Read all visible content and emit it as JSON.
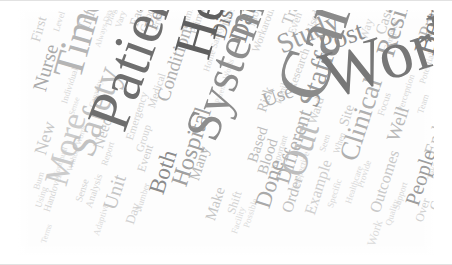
{
  "figure": {
    "type": "word-cloud",
    "width": 452,
    "height": 265,
    "background_color": "#ffffff",
    "canvas_color": "#fdfdfd",
    "palette": [
      "#5e5e5e",
      "#7a7a7a",
      "#8f8f8f",
      "#a6a6a6",
      "#bcbcbc",
      "#cfcfcf",
      "#dcdcdc",
      "#6b6b6b",
      "#999999"
    ],
    "font_style": "serif"
  },
  "chart_data": {
    "type": "word-cloud",
    "title": "",
    "words": [
      {
        "text": "Work",
        "weight": 100,
        "x": 295,
        "y": 38,
        "size": 68,
        "rot": -18,
        "color": "#777777"
      },
      {
        "text": "Care",
        "weight": 98,
        "x": 248,
        "y": 78,
        "size": 72,
        "rot": -72,
        "color": "#8a8a8a"
      },
      {
        "text": "Patient",
        "weight": 95,
        "x": 62,
        "y": 108,
        "size": 60,
        "rot": -70,
        "color": "#6e6e6e"
      },
      {
        "text": "Health",
        "weight": 88,
        "x": 150,
        "y": 40,
        "size": 54,
        "rot": -74,
        "color": "#5f5f5f"
      },
      {
        "text": "System",
        "weight": 85,
        "x": 160,
        "y": 120,
        "size": 50,
        "rot": -70,
        "color": "#8d8d8d"
      },
      {
        "text": "Time",
        "weight": 70,
        "x": 30,
        "y": 62,
        "size": 42,
        "rot": -74,
        "color": "#b5b5b5"
      },
      {
        "text": "Safety",
        "weight": 62,
        "x": 48,
        "y": 140,
        "size": 36,
        "rot": -72,
        "color": "#c2c2c2"
      },
      {
        "text": "More",
        "weight": 58,
        "x": 22,
        "y": 170,
        "size": 34,
        "rot": -74,
        "color": "#cccccc"
      },
      {
        "text": "Out",
        "weight": 56,
        "x": 258,
        "y": 160,
        "size": 36,
        "rot": -72,
        "color": "#bdbdbd"
      },
      {
        "text": "Between",
        "weight": 55,
        "x": 392,
        "y": 40,
        "size": 30,
        "rot": -74,
        "color": "#7d7d7d"
      },
      {
        "text": "Resilience",
        "weight": 54,
        "x": 355,
        "y": 42,
        "size": 27,
        "rot": -73,
        "color": "#a4a4a4"
      },
      {
        "text": "Staff",
        "weight": 50,
        "x": 277,
        "y": 92,
        "size": 29,
        "rot": -72,
        "color": "#9a9a9a"
      },
      {
        "text": "Study",
        "weight": 49,
        "x": 255,
        "y": 24,
        "size": 28,
        "rot": -24,
        "color": "#9f9f9f"
      },
      {
        "text": "Clinical",
        "weight": 48,
        "x": 318,
        "y": 146,
        "size": 27,
        "rot": -72,
        "color": "#b0b0b0"
      },
      {
        "text": "Post",
        "weight": 46,
        "x": 297,
        "y": 24,
        "size": 27,
        "rot": -20,
        "color": "#8f8f8f"
      },
      {
        "text": "Data",
        "weight": 45,
        "x": 208,
        "y": 28,
        "size": 26,
        "rot": -73,
        "color": "#8b8b8b"
      },
      {
        "text": "Hospital",
        "weight": 44,
        "x": 150,
        "y": 172,
        "size": 24,
        "rot": -72,
        "color": "#a0a0a0"
      },
      {
        "text": "Discharge",
        "weight": 43,
        "x": 190,
        "y": 26,
        "size": 22,
        "rot": -73,
        "color": "#7f7f7f"
      },
      {
        "text": "Both",
        "weight": 42,
        "x": 128,
        "y": 180,
        "size": 23,
        "rot": -72,
        "color": "#8c8c8c"
      },
      {
        "text": "Done",
        "weight": 40,
        "x": 234,
        "y": 194,
        "size": 23,
        "rot": -72,
        "color": "#a9a9a9"
      },
      {
        "text": "Different",
        "weight": 39,
        "x": 255,
        "y": 170,
        "size": 21,
        "rot": -72,
        "color": "#b2b2b2"
      },
      {
        "text": "People",
        "weight": 38,
        "x": 385,
        "y": 192,
        "size": 21,
        "rot": -72,
        "color": "#9d9d9d"
      },
      {
        "text": "Unit",
        "weight": 36,
        "x": 82,
        "y": 196,
        "size": 20,
        "rot": -72,
        "color": "#c5c5c5"
      },
      {
        "text": "Nurse",
        "weight": 35,
        "x": 12,
        "y": 78,
        "size": 20,
        "rot": -74,
        "color": "#aaaaaa"
      },
      {
        "text": "Performance",
        "weight": 34,
        "x": 124,
        "y": 16,
        "size": 19,
        "rot": -70,
        "color": "#a3a3a3"
      },
      {
        "text": "Conditions",
        "weight": 33,
        "x": 136,
        "y": 88,
        "size": 19,
        "rot": -72,
        "color": "#b1b1b1"
      },
      {
        "text": "Practice",
        "weight": 32,
        "x": 398,
        "y": 24,
        "size": 19,
        "rot": -72,
        "color": "#b6b6b6"
      },
      {
        "text": "Well",
        "weight": 31,
        "x": 366,
        "y": 128,
        "size": 19,
        "rot": -72,
        "color": "#b8b8b8"
      },
      {
        "text": "Use",
        "weight": 31,
        "x": 242,
        "y": 82,
        "size": 20,
        "rot": -20,
        "color": "#adadad"
      },
      {
        "text": "Information",
        "weight": 30,
        "x": 58,
        "y": 16,
        "size": 17,
        "rot": -68,
        "color": "#c0c0c0"
      },
      {
        "text": "New",
        "weight": 29,
        "x": 14,
        "y": 142,
        "size": 18,
        "rot": -73,
        "color": "#c8c8c8"
      },
      {
        "text": "End",
        "weight": 28,
        "x": 404,
        "y": 142,
        "size": 18,
        "rot": -72,
        "color": "#c4c4c4"
      },
      {
        "text": "Outcomes",
        "weight": 27,
        "x": 350,
        "y": 200,
        "size": 16,
        "rot": -72,
        "color": "#c9c9c9"
      },
      {
        "text": "Example",
        "weight": 26,
        "x": 285,
        "y": 202,
        "size": 16,
        "rot": -72,
        "color": "#cfcfcf"
      },
      {
        "text": "Order",
        "weight": 25,
        "x": 262,
        "y": 200,
        "size": 16,
        "rot": -72,
        "color": "#c1c1c1"
      },
      {
        "text": "Many",
        "weight": 25,
        "x": 170,
        "y": 168,
        "size": 15,
        "rot": -72,
        "color": "#b9b9b9"
      },
      {
        "text": "Make",
        "weight": 24,
        "x": 186,
        "y": 208,
        "size": 15,
        "rot": -72,
        "color": "#c6c6c6"
      },
      {
        "text": "Blood",
        "weight": 24,
        "x": 238,
        "y": 162,
        "size": 15,
        "rot": -72,
        "color": "#bcbcbc"
      },
      {
        "text": "Based",
        "weight": 23,
        "x": 228,
        "y": 150,
        "size": 15,
        "rot": -72,
        "color": "#bebebe"
      },
      {
        "text": "Trade",
        "weight": 23,
        "x": 262,
        "y": 12,
        "size": 16,
        "rot": -70,
        "color": "#c3c3c3"
      },
      {
        "text": "Cases",
        "weight": 22,
        "x": 356,
        "y": 22,
        "size": 15,
        "rot": -72,
        "color": "#cacaca"
      },
      {
        "text": "Need",
        "weight": 22,
        "x": 74,
        "y": 136,
        "size": 15,
        "rot": -72,
        "color": "#c7c7c7"
      },
      {
        "text": "First",
        "weight": 21,
        "x": 12,
        "y": 30,
        "size": 14,
        "rot": -74,
        "color": "#cdcdcd"
      },
      {
        "text": "Risk",
        "weight": 21,
        "x": 238,
        "y": 100,
        "size": 14,
        "rot": -72,
        "color": "#c2c2c2"
      },
      {
        "text": "Site",
        "weight": 20,
        "x": 320,
        "y": 114,
        "size": 14,
        "rot": -72,
        "color": "#cbcbcb"
      },
      {
        "text": "Ward",
        "weight": 20,
        "x": 288,
        "y": 112,
        "size": 13,
        "rot": -72,
        "color": "#d0d0d0"
      },
      {
        "text": "Research",
        "weight": 20,
        "x": 268,
        "y": 78,
        "size": 12,
        "rot": -70,
        "color": "#cfcfcf"
      },
      {
        "text": "Workarounds",
        "weight": 19,
        "x": 232,
        "y": 40,
        "size": 11,
        "rot": -70,
        "color": "#d2d2d2"
      },
      {
        "text": "Case",
        "weight": 19,
        "x": 410,
        "y": 198,
        "size": 13,
        "rot": -72,
        "color": "#cccccc"
      },
      {
        "text": "Over",
        "weight": 18,
        "x": 396,
        "y": 210,
        "size": 12,
        "rot": -72,
        "color": "#d0d0d0"
      },
      {
        "text": "Within",
        "weight": 18,
        "x": 412,
        "y": 16,
        "size": 12,
        "rot": -72,
        "color": "#cacaca"
      },
      {
        "text": "Each",
        "weight": 18,
        "x": 110,
        "y": 14,
        "size": 13,
        "rot": -72,
        "color": "#cbcbcb"
      },
      {
        "text": "Good",
        "weight": 17,
        "x": 120,
        "y": 20,
        "size": 11,
        "rot": -72,
        "color": "#d4d4d4"
      },
      {
        "text": "Day",
        "weight": 17,
        "x": 106,
        "y": 212,
        "size": 13,
        "rot": -72,
        "color": "#d1d1d1"
      },
      {
        "text": "Event",
        "weight": 17,
        "x": 118,
        "y": 160,
        "size": 12,
        "rot": -72,
        "color": "#cecece"
      },
      {
        "text": "Shift",
        "weight": 16,
        "x": 208,
        "y": 202,
        "size": 12,
        "rot": -72,
        "color": "#d3d3d3"
      },
      {
        "text": "Medical",
        "weight": 16,
        "x": 128,
        "y": 96,
        "size": 11,
        "rot": -72,
        "color": "#d2d2d2"
      },
      {
        "text": "Emergency",
        "weight": 16,
        "x": 106,
        "y": 128,
        "size": 11,
        "rot": -72,
        "color": "#d5d5d5"
      },
      {
        "text": "Group",
        "weight": 16,
        "x": 116,
        "y": 140,
        "size": 11,
        "rot": -72,
        "color": "#d3d3d3"
      },
      {
        "text": "Process",
        "weight": 15,
        "x": 132,
        "y": 18,
        "size": 10,
        "rot": -72,
        "color": "#d6d6d6"
      },
      {
        "text": "Primary",
        "weight": 15,
        "x": 170,
        "y": 22,
        "size": 11,
        "rot": -72,
        "color": "#cdcdcd"
      },
      {
        "text": "Seamless",
        "weight": 15,
        "x": 160,
        "y": 20,
        "size": 10,
        "rot": -72,
        "color": "#d8d8d8"
      },
      {
        "text": "Home Safety",
        "weight": 14,
        "x": 184,
        "y": 60,
        "size": 9,
        "rot": -72,
        "color": "#d7d7d7"
      },
      {
        "text": "Those",
        "weight": 14,
        "x": 202,
        "y": 16,
        "size": 11,
        "rot": -72,
        "color": "#d4d4d4"
      },
      {
        "text": "Mode",
        "weight": 14,
        "x": 228,
        "y": 14,
        "size": 11,
        "rot": -72,
        "color": "#d5d5d5"
      },
      {
        "text": "Even",
        "weight": 14,
        "x": 268,
        "y": 22,
        "size": 11,
        "rot": -70,
        "color": "#d3d3d3"
      },
      {
        "text": "Used",
        "weight": 14,
        "x": 286,
        "y": 20,
        "size": 11,
        "rot": -70,
        "color": "#d1d1d1"
      },
      {
        "text": "Way",
        "weight": 14,
        "x": 340,
        "y": 28,
        "size": 12,
        "rot": -72,
        "color": "#d6d6d6"
      },
      {
        "text": "Complex",
        "weight": 13,
        "x": 364,
        "y": 40,
        "size": 9,
        "rot": -72,
        "color": "#d7d7d7"
      },
      {
        "text": "Focus",
        "weight": 13,
        "x": 358,
        "y": 104,
        "size": 10,
        "rot": -72,
        "color": "#d5d5d5"
      },
      {
        "text": "Potential",
        "weight": 13,
        "x": 400,
        "y": 72,
        "size": 9,
        "rot": -72,
        "color": "#d8d8d8"
      },
      {
        "text": "Implementation",
        "weight": 13,
        "x": 424,
        "y": 48,
        "size": 9,
        "rot": -72,
        "color": "#d9d9d9"
      },
      {
        "text": "Team",
        "weight": 13,
        "x": 398,
        "y": 102,
        "size": 9,
        "rot": -72,
        "color": "#d6d6d6"
      },
      {
        "text": "Perception",
        "weight": 12,
        "x": 378,
        "y": 100,
        "size": 9,
        "rot": -72,
        "color": "#d8d8d8"
      },
      {
        "text": "Human",
        "weight": 12,
        "x": 418,
        "y": 138,
        "size": 10,
        "rot": -72,
        "color": "#d4d4d4"
      },
      {
        "text": "Medication",
        "weight": 12,
        "x": 428,
        "y": 178,
        "size": 10,
        "rot": -72,
        "color": "#d5d5d5"
      },
      {
        "text": "Support",
        "weight": 12,
        "x": 374,
        "y": 198,
        "size": 9,
        "rot": -72,
        "color": "#d9d9d9"
      },
      {
        "text": "Quality",
        "weight": 12,
        "x": 366,
        "y": 214,
        "size": 9,
        "rot": -72,
        "color": "#dadada"
      },
      {
        "text": "Provide",
        "weight": 12,
        "x": 338,
        "y": 176,
        "size": 9,
        "rot": -72,
        "color": "#d7d7d7"
      },
      {
        "text": "Seen",
        "weight": 12,
        "x": 300,
        "y": 140,
        "size": 9,
        "rot": -72,
        "color": "#d6d6d6"
      },
      {
        "text": "When",
        "weight": 12,
        "x": 314,
        "y": 142,
        "size": 9,
        "rot": -72,
        "color": "#d4d4d4"
      },
      {
        "text": "Healthcare",
        "weight": 11,
        "x": 326,
        "y": 192,
        "size": 9,
        "rot": -72,
        "color": "#dadada"
      },
      {
        "text": "Specific",
        "weight": 11,
        "x": 308,
        "y": 196,
        "size": 9,
        "rot": -72,
        "color": "#d8d8d8"
      },
      {
        "text": "Perspective",
        "weight": 11,
        "x": 272,
        "y": 180,
        "size": 9,
        "rot": -72,
        "color": "#d9d9d9"
      },
      {
        "text": "Important",
        "weight": 11,
        "x": 252,
        "y": 158,
        "size": 9,
        "rot": -72,
        "color": "#d7d7d7"
      },
      {
        "text": "Possible",
        "weight": 11,
        "x": 224,
        "y": 216,
        "size": 9,
        "rot": -72,
        "color": "#dbdbdb"
      },
      {
        "text": "Facility",
        "weight": 11,
        "x": 212,
        "y": 222,
        "size": 9,
        "rot": -72,
        "color": "#dadada"
      },
      {
        "text": "Number",
        "weight": 11,
        "x": 116,
        "y": 200,
        "size": 9,
        "rot": -72,
        "color": "#d8d8d8"
      },
      {
        "text": "Analysis",
        "weight": 11,
        "x": 66,
        "y": 196,
        "size": 10,
        "rot": -72,
        "color": "#d6d6d6"
      },
      {
        "text": "Sense",
        "weight": 11,
        "x": 56,
        "y": 190,
        "size": 10,
        "rot": -72,
        "color": "#d5d5d5"
      },
      {
        "text": "Handover",
        "weight": 11,
        "x": 24,
        "y": 200,
        "size": 10,
        "rot": -72,
        "color": "#d7d7d7"
      },
      {
        "text": "Using",
        "weight": 10,
        "x": 16,
        "y": 196,
        "size": 9,
        "rot": -72,
        "color": "#d9d9d9"
      },
      {
        "text": "Adaptive",
        "weight": 10,
        "x": 74,
        "y": 224,
        "size": 9,
        "rot": -72,
        "color": "#dbdbdb"
      },
      {
        "text": "Report",
        "weight": 10,
        "x": 82,
        "y": 154,
        "size": 9,
        "rot": -72,
        "color": "#d8d8d8"
      },
      {
        "text": "Without Words",
        "weight": 10,
        "x": 48,
        "y": 160,
        "size": 8,
        "rot": -72,
        "color": "#dcdcdc"
      },
      {
        "text": "Individual",
        "weight": 10,
        "x": 42,
        "y": 92,
        "size": 9,
        "rot": -72,
        "color": "#d7d7d7"
      },
      {
        "text": "Sense",
        "weight": 10,
        "x": 50,
        "y": 104,
        "size": 8,
        "rot": -72,
        "color": "#dcdcdc"
      },
      {
        "text": "Continual",
        "weight": 10,
        "x": 34,
        "y": 166,
        "size": 8,
        "rot": -72,
        "color": "#dbdbdb"
      },
      {
        "text": "Capacity",
        "weight": 10,
        "x": 70,
        "y": 96,
        "size": 8,
        "rot": -72,
        "color": "#dcdcdc"
      },
      {
        "text": "Level",
        "weight": 10,
        "x": 34,
        "y": 20,
        "size": 9,
        "rot": -72,
        "color": "#d8d8d8"
      },
      {
        "text": "Diagram",
        "weight": 10,
        "x": 86,
        "y": 14,
        "size": 9,
        "rot": -72,
        "color": "#d9d9d9"
      },
      {
        "text": "Vary",
        "weight": 10,
        "x": 96,
        "y": 16,
        "size": 9,
        "rot": -72,
        "color": "#d6d6d6"
      },
      {
        "text": "Always Day",
        "weight": 9,
        "x": 76,
        "y": 36,
        "size": 8,
        "rot": -72,
        "color": "#dcdcdc"
      },
      {
        "text": "Family",
        "weight": 9,
        "x": 256,
        "y": 92,
        "size": 9,
        "rot": -72,
        "color": "#d6d6d6"
      },
      {
        "text": "Parents Words",
        "weight": 9,
        "x": 196,
        "y": 92,
        "size": 8,
        "rot": -72,
        "color": "#dcdcdc"
      },
      {
        "text": "Take",
        "weight": 9,
        "x": 408,
        "y": 168,
        "size": 9,
        "rot": -72,
        "color": "#d7d7d7"
      },
      {
        "text": "Burn",
        "weight": 9,
        "x": 14,
        "y": 178,
        "size": 9,
        "rot": -72,
        "color": "#dadada"
      },
      {
        "text": "Work",
        "weight": 9,
        "x": 348,
        "y": 234,
        "size": 12,
        "rot": -72,
        "color": "#dadada"
      },
      {
        "text": "Terms",
        "weight": 9,
        "x": 22,
        "y": 232,
        "size": 8,
        "rot": -72,
        "color": "#dcdcdc"
      }
    ]
  }
}
